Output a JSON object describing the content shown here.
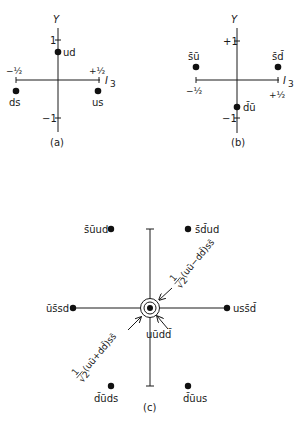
{
  "panels": {
    "a": {
      "caption": "(a)",
      "y_axis_label": "Y",
      "x_axis_label": "I",
      "x_axis_sub": "3",
      "ticks": {
        "y_pos": "1",
        "y_neg": "−1",
        "x_neg": "−½",
        "x_pos": "+½"
      },
      "states": [
        {
          "label": "ud",
          "I3": 0,
          "Y": 0.5
        },
        {
          "label": "ds",
          "I3": -0.5,
          "Y": -0.5
        },
        {
          "label": "us",
          "I3": 0.5,
          "Y": -0.5
        }
      ]
    },
    "b": {
      "caption": "(b)",
      "y_axis_label": "Y",
      "x_axis_label": "I",
      "x_axis_sub": "3",
      "ticks": {
        "y_pos": "+1",
        "y_neg": "−1",
        "x_neg": "−½",
        "x_pos": "+½"
      },
      "states": [
        {
          "label": "s̄ū",
          "I3": -0.5,
          "Y": 0.5
        },
        {
          "label": "s̄d̄",
          "I3": 0.5,
          "Y": 0.5
        },
        {
          "label": "d̄ū",
          "I3": 0,
          "Y": -0.5
        }
      ]
    },
    "c": {
      "caption": "(c)",
      "states": [
        {
          "label": "s̄ūud",
          "position": "upper-left"
        },
        {
          "label": "s̄d̄ud",
          "position": "upper-right"
        },
        {
          "label": "ūs̄sd",
          "position": "left"
        },
        {
          "label": "uss̄d̄",
          "position": "right"
        },
        {
          "label": "d̄ūds",
          "position": "lower-left"
        },
        {
          "label": "d̄ūus",
          "position": "lower-right"
        }
      ],
      "center_labels": {
        "upper": "1/√2 (uū−dd̄)ss̄",
        "upper_frac": "1",
        "upper_den": "√2",
        "upper_expr": "(uū−dd̄)ss̄",
        "lower": "1/√2 (uū+dd̄)ss̄",
        "lower_frac": "1",
        "lower_den": "√2",
        "lower_expr": "(uū+dd̄)ss̄",
        "right": "uūdd̄"
      }
    }
  }
}
